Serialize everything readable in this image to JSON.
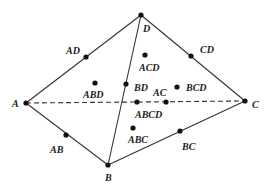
{
  "diagram": {
    "type": "tetrahedron-subset-lattice",
    "colors": {
      "line": "#333333",
      "dot": "#111111",
      "text": "#222222",
      "background": "#ffffff"
    },
    "vertices": [
      {
        "id": "A",
        "label": "A",
        "x": 26,
        "y": 103,
        "lx": 12,
        "ly": 107
      },
      {
        "id": "B",
        "label": "B",
        "x": 108,
        "y": 165,
        "lx": 105,
        "ly": 181
      },
      {
        "id": "C",
        "label": "C",
        "x": 245,
        "y": 101,
        "lx": 252,
        "ly": 108
      },
      {
        "id": "D",
        "label": "D",
        "x": 141,
        "y": 15,
        "lx": 143,
        "ly": 32
      }
    ],
    "edge_points": [
      {
        "id": "AD",
        "label": "AD",
        "x": 86,
        "y": 57,
        "lx": 66,
        "ly": 54
      },
      {
        "id": "CD",
        "label": "CD",
        "x": 191,
        "y": 56,
        "lx": 200,
        "ly": 53
      },
      {
        "id": "BD",
        "label": "BD",
        "x": 126,
        "y": 84,
        "lx": 134,
        "ly": 91
      },
      {
        "id": "AC",
        "label": "AC",
        "x": 166,
        "y": 102,
        "lx": 153,
        "ly": 96
      },
      {
        "id": "AB",
        "label": "AB",
        "x": 66,
        "y": 135,
        "lx": 50,
        "ly": 153
      },
      {
        "id": "BC",
        "label": "BC",
        "x": 180,
        "y": 131,
        "lx": 182,
        "ly": 150
      }
    ],
    "face_points": [
      {
        "id": "ABD",
        "label": "ABD",
        "x": 95,
        "y": 83,
        "lx": 83,
        "ly": 98
      },
      {
        "id": "ACD",
        "label": "ACD",
        "x": 145,
        "y": 55,
        "lx": 139,
        "ly": 71
      },
      {
        "id": "BCD",
        "label": "BCD",
        "x": 177,
        "y": 87,
        "lx": 186,
        "ly": 91
      },
      {
        "id": "ABC",
        "label": "ABC",
        "x": 133,
        "y": 128,
        "lx": 128,
        "ly": 143
      }
    ],
    "center_point": {
      "id": "ABCD",
      "label": "ABCD",
      "x": 137,
      "y": 102,
      "lx": 135,
      "ly": 118
    },
    "solid_edges": [
      [
        "A",
        "D"
      ],
      [
        "D",
        "C"
      ],
      [
        "A",
        "B"
      ],
      [
        "B",
        "C"
      ],
      [
        "B",
        "D"
      ]
    ],
    "dashed_edges": [
      [
        "A",
        "C"
      ]
    ]
  }
}
